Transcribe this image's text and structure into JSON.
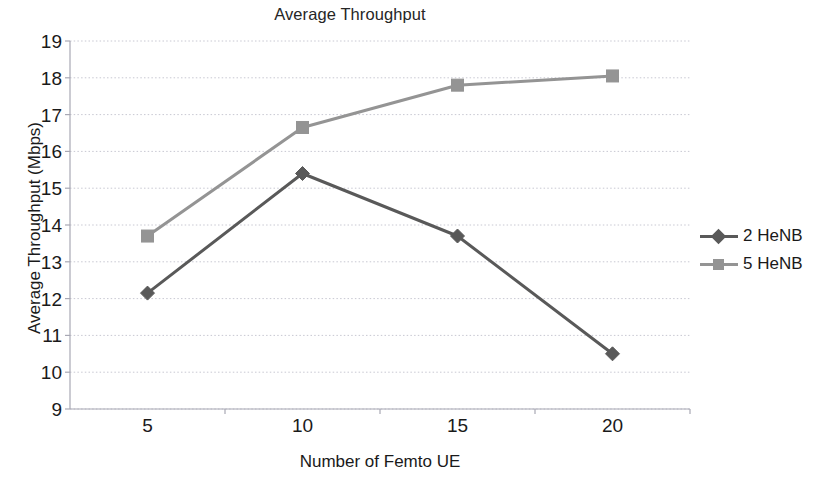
{
  "chart_data": {
    "type": "line",
    "title": "Average Throughput",
    "xlabel": "Number of Femto UE",
    "ylabel": "Average Throughput (Mbps)",
    "x": [
      5,
      10,
      15,
      20
    ],
    "xtick_labels": [
      "5",
      "10",
      "15",
      "20"
    ],
    "ytick_labels": [
      "19",
      "18",
      "17",
      "16",
      "15",
      "14",
      "13",
      "12",
      "11",
      "10",
      "9"
    ],
    "xlim": [
      2.5,
      22.5
    ],
    "ylim": [
      9,
      19
    ],
    "grid": "horizontal",
    "legend_position": "right",
    "series": [
      {
        "name": "2 HeNB",
        "values": [
          12.15,
          15.4,
          13.7,
          10.5
        ],
        "color": "#595959",
        "marker": "diamond"
      },
      {
        "name": "5 HeNB",
        "values": [
          13.7,
          16.65,
          17.8,
          18.05
        ],
        "color": "#949494",
        "marker": "square"
      }
    ]
  },
  "legend": {
    "items": [
      {
        "label": "2 HeNB"
      },
      {
        "label": "5 HeNB"
      }
    ]
  },
  "colors": {
    "series_2henb": "#595959",
    "series_5henb": "#949494",
    "gridline": "#c8c8d2",
    "axis": "#a8a8b4",
    "text": "#1a1a1a"
  }
}
